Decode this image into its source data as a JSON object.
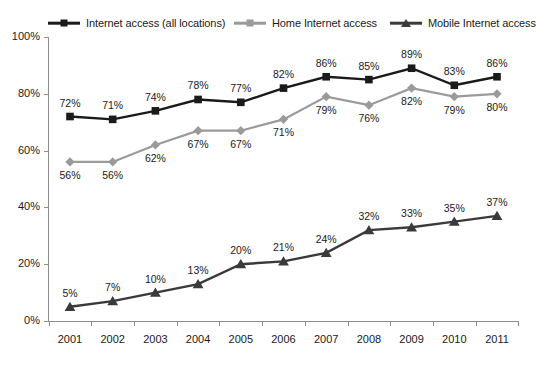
{
  "chart_data": {
    "type": "line",
    "title": "",
    "subtitle": "",
    "xlabel": "",
    "ylabel": "",
    "categories": [
      "2001",
      "2002",
      "2003",
      "2004",
      "2005",
      "2006",
      "2007",
      "2008",
      "2009",
      "2010",
      "2011"
    ],
    "ylim": [
      0,
      100
    ],
    "yticks": [
      "0%",
      "20%",
      "40%",
      "60%",
      "80%",
      "100%"
    ],
    "ytick_values": [
      0,
      20,
      40,
      60,
      80,
      100
    ],
    "grid": false,
    "legend_position": "top",
    "series": [
      {
        "name": "Internet access (all locations)",
        "marker": "square",
        "color": "#1a1a1a",
        "label_position": "above",
        "values": [
          72,
          71,
          74,
          78,
          77,
          82,
          86,
          85,
          89,
          83,
          86
        ],
        "labels": [
          "72%",
          "71%",
          "74%",
          "78%",
          "77%",
          "82%",
          "86%",
          "85%",
          "89%",
          "83%",
          "86%"
        ]
      },
      {
        "name": "Home Internet access",
        "marker": "diamond",
        "color": "#9a9a9a",
        "label_position": "below",
        "values": [
          56,
          56,
          62,
          67,
          67,
          71,
          79,
          76,
          82,
          79,
          80
        ],
        "labels": [
          "56%",
          "56%",
          "62%",
          "67%",
          "67%",
          "71%",
          "79%",
          "76%",
          "82%",
          "79%",
          "80%"
        ]
      },
      {
        "name": "Mobile Internet access",
        "marker": "triangle",
        "color": "#3a3a3a",
        "label_position": "above",
        "values": [
          5,
          7,
          10,
          13,
          20,
          21,
          24,
          32,
          33,
          35,
          37
        ],
        "labels": [
          "5%",
          "7%",
          "10%",
          "13%",
          "20%",
          "21%",
          "24%",
          "32%",
          "33%",
          "35%",
          "37%"
        ]
      }
    ]
  },
  "legend": {
    "items": [
      {
        "label": "Internet access (all locations)",
        "icon": "square-marker-icon"
      },
      {
        "label": "Home Internet access",
        "icon": "diamond-marker-icon"
      },
      {
        "label": "Mobile Internet access",
        "icon": "triangle-marker-icon"
      }
    ]
  },
  "colors": {
    "series_dark": "#1a1a1a",
    "series_gray": "#9a9a9a",
    "series_mobile": "#3a3a3a",
    "axis": "#8d8d8d",
    "background": "#ffffff"
  }
}
